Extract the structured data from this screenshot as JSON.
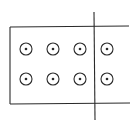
{
  "diagram": {
    "type": "magnetic-field-region",
    "colors": {
      "line": "#2a2a2a",
      "background": "#ffffff"
    },
    "region": {
      "left": 10,
      "top": 27,
      "bottom": 104,
      "right_open_end": 129,
      "shape": "rectangle open on right side"
    },
    "divider_line": {
      "x": 94,
      "y1": 12,
      "y2": 120
    },
    "field_symbols": {
      "symbol": "dot-in-circle (field out of page)",
      "radius": 6,
      "rows": [
        49,
        79
      ],
      "columns": [
        26,
        53,
        80,
        107
      ]
    }
  }
}
